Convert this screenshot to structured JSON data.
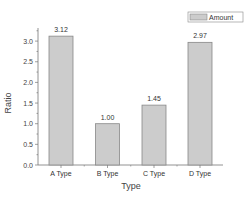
{
  "chart_data": {
    "type": "bar",
    "title": "",
    "xlabel": "Type",
    "ylabel": "Ratio",
    "categories": [
      "A Type",
      "B Type",
      "C Type",
      "D Type"
    ],
    "series": [
      {
        "name": "Amount",
        "values": [
          3.12,
          1.0,
          1.45,
          2.97
        ]
      }
    ],
    "data_labels": [
      "3.12",
      "1.00",
      "1.45",
      "2.97"
    ],
    "ylim": [
      0,
      3.3
    ],
    "yticks": [
      "0.0",
      "0.5",
      "1.0",
      "1.5",
      "2.0",
      "2.5",
      "3.0"
    ],
    "grid": false,
    "legend_position": "top-right"
  },
  "colors": {
    "bar_fill": "#cccccc",
    "bar_stroke": "#888888",
    "axis": "#777777"
  }
}
